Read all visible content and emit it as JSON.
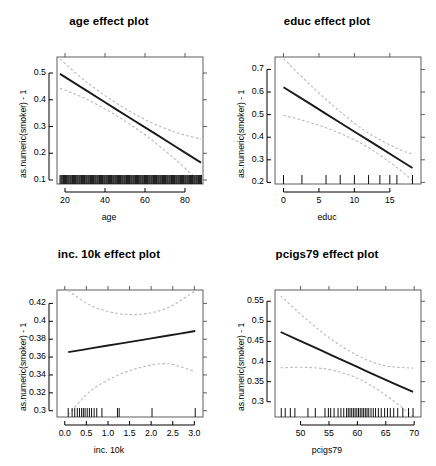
{
  "figure": {
    "layout": "2x2-grid",
    "width": 436,
    "height": 466,
    "background": "#ffffff",
    "fit_color": "#1a1a1a",
    "ci_color": "#b9b9b9",
    "rug_color": "#111111",
    "box_color": "#4d4d4d"
  },
  "chart_data": [
    {
      "type": "line",
      "title": "age effect plot",
      "xlabel": "age",
      "ylabel": "as.numeric(smoker) - 1",
      "xlim": [
        16,
        89
      ],
      "ylim": [
        0.085,
        0.56
      ],
      "xticks": [
        20,
        40,
        60,
        80
      ],
      "xtick_labels": [
        "20",
        "40",
        "60",
        "80"
      ],
      "yticks": [
        0.1,
        0.2,
        0.3,
        0.4,
        0.5
      ],
      "ytick_labels": [
        "0.1",
        "0.2",
        "0.3",
        "0.4",
        "0.5"
      ],
      "grid": false,
      "legend": "none",
      "series": [
        {
          "name": "fit",
          "style": "solid",
          "x": [
            17.5,
            30,
            45,
            60,
            75,
            88
          ],
          "values": [
            0.497,
            0.438,
            0.367,
            0.297,
            0.226,
            0.165
          ]
        },
        {
          "name": "upper 95% CI",
          "style": "dashed",
          "x": [
            17.5,
            30,
            45,
            60,
            75,
            88
          ],
          "values": [
            0.552,
            0.471,
            0.391,
            0.326,
            0.279,
            0.253
          ]
        },
        {
          "name": "lower 95% CI",
          "style": "dashed",
          "x": [
            17.5,
            30,
            45,
            60,
            75,
            88
          ],
          "values": [
            0.443,
            0.405,
            0.344,
            0.269,
            0.178,
            0.088
          ]
        }
      ],
      "rug": {
        "axis": "x",
        "note": "dense rug of observed age values across full range",
        "values": [
          17.5,
          18,
          18.4,
          18.9,
          19.3,
          19.8,
          20.2,
          20.7,
          21.1,
          21.6,
          22,
          22.5,
          22.9,
          23.4,
          23.8,
          24.3,
          24.7,
          25.2,
          25.6,
          26.1,
          26.5,
          27,
          27.4,
          27.9,
          28.3,
          28.8,
          29.2,
          29.7,
          30.1,
          30.6,
          31,
          31.5,
          31.9,
          32.4,
          32.8,
          33.3,
          33.7,
          34.2,
          34.6,
          35.1,
          35.5,
          36,
          36.4,
          36.9,
          37.3,
          37.8,
          38.2,
          38.7,
          39.1,
          39.6,
          40,
          40.5,
          40.9,
          41.4,
          41.8,
          42.3,
          42.7,
          43.2,
          43.6,
          44.1,
          44.5,
          45,
          45.4,
          45.9,
          46.3,
          46.8,
          47.2,
          47.7,
          48.1,
          48.6,
          49,
          49.5,
          49.9,
          50.4,
          50.8,
          51.3,
          51.7,
          52.2,
          52.6,
          53.1,
          53.5,
          54,
          54.4,
          54.9,
          55.3,
          55.8,
          56.2,
          56.7,
          57.1,
          57.6,
          58,
          58.5,
          58.9,
          59.4,
          59.8,
          60.3,
          60.7,
          61.2,
          61.6,
          62.1,
          62.5,
          63,
          63.4,
          63.9,
          64.3,
          64.8,
          65.2,
          65.7,
          66.1,
          66.6,
          67,
          67.5,
          67.9,
          68.4,
          68.8,
          69.3,
          69.7,
          70.2,
          70.6,
          71.1,
          71.5,
          72,
          72.4,
          72.9,
          73.3,
          73.8,
          74.2,
          74.7,
          75.1,
          75.6,
          76,
          76.5,
          76.9,
          77.4,
          77.8,
          78.3,
          78.7,
          79.2,
          79.6,
          80.1,
          80.5,
          81,
          81.4,
          81.9,
          82.3,
          82.8,
          83.2,
          83.7,
          84.1,
          84.6,
          85,
          85.5,
          85.9,
          86.4,
          86.8,
          87.3,
          87.7,
          88.2
        ]
      }
    },
    {
      "type": "line",
      "title": "educ effect plot",
      "xlabel": "educ",
      "ylabel": "as.numeric(smoker) - 1",
      "xlim": [
        -1.2,
        19.4
      ],
      "ylim": [
        0.193,
        0.755
      ],
      "xticks": [
        0,
        5,
        10,
        15
      ],
      "xtick_labels": [
        "0",
        "5",
        "10",
        "15"
      ],
      "yticks": [
        0.2,
        0.3,
        0.4,
        0.5,
        0.6,
        0.7
      ],
      "ytick_labels": [
        "0.2",
        "0.3",
        "0.4",
        "0.5",
        "0.6",
        "0.7"
      ],
      "grid": false,
      "legend": "none",
      "series": [
        {
          "name": "fit",
          "style": "solid",
          "x": [
            0,
            4,
            8,
            12,
            16,
            18.2
          ],
          "values": [
            0.621,
            0.543,
            0.464,
            0.386,
            0.307,
            0.264
          ]
        },
        {
          "name": "upper 95% CI",
          "style": "dashed",
          "x": [
            0,
            4,
            8,
            12,
            16,
            18.2
          ],
          "values": [
            0.748,
            0.625,
            0.513,
            0.418,
            0.351,
            0.325
          ]
        },
        {
          "name": "lower 95% CI",
          "style": "dashed",
          "x": [
            0,
            4,
            8,
            12,
            16,
            18.2
          ],
          "values": [
            0.497,
            0.463,
            0.417,
            0.354,
            0.266,
            0.208
          ]
        }
      ],
      "rug": {
        "axis": "x",
        "note": "rug at discrete education levels",
        "values": [
          0,
          2.6,
          6,
          8,
          10,
          12,
          13.6,
          15,
          16,
          18.2
        ]
      }
    },
    {
      "type": "line",
      "title": "inc. 10k effect plot",
      "xlabel": "inc. 10k",
      "ylabel": "as.numeric(smoker) - 1",
      "xlim": [
        -0.18,
        3.2
      ],
      "ylim": [
        0.293,
        0.435
      ],
      "xticks": [
        0.0,
        0.5,
        1.0,
        1.5,
        2.0,
        2.5,
        3.0
      ],
      "xtick_labels": [
        "0.0",
        "0.5",
        "1.0",
        "1.5",
        "2.0",
        "2.5",
        "3.0"
      ],
      "yticks": [
        0.3,
        0.32,
        0.34,
        0.36,
        0.38,
        0.4,
        0.42
      ],
      "ytick_labels": [
        "0.3",
        "0.32",
        "0.34",
        "0.36",
        "0.38",
        "0.4",
        "0.42"
      ],
      "grid": false,
      "legend": "none",
      "series": [
        {
          "name": "fit",
          "style": "solid",
          "x": [
            0.08,
            0.6,
            1.2,
            1.8,
            2.4,
            3.02
          ],
          "values": [
            0.3655,
            0.3697,
            0.3745,
            0.3793,
            0.3841,
            0.3891
          ]
        },
        {
          "name": "upper 95% CI",
          "style": "dashed",
          "x": [
            0.08,
            0.6,
            1.2,
            1.8,
            2.4,
            3.02
          ],
          "values": [
            0.4345,
            0.4177,
            0.409,
            0.408,
            0.4155,
            0.434
          ]
        },
        {
          "name": "lower 95% CI",
          "style": "dashed",
          "x": [
            0.08,
            0.6,
            1.2,
            1.8,
            2.4,
            3.02
          ],
          "values": [
            0.2955,
            0.3222,
            0.339,
            0.349,
            0.3525,
            0.3435
          ]
        }
      ],
      "rug": {
        "axis": "x",
        "note": "rug concentrated at low incomes",
        "values": [
          0.08,
          0.17,
          0.23,
          0.29,
          0.34,
          0.39,
          0.43,
          0.47,
          0.52,
          0.57,
          0.62,
          0.68,
          0.74,
          0.86,
          1.22,
          1.26,
          2.02,
          3.02
        ]
      }
    },
    {
      "type": "line",
      "title": "pcigs79 effect plot",
      "xlabel": "pcigs79",
      "ylabel": "as.numeric(smoker) - 1",
      "xlim": [
        45.5,
        71.2
      ],
      "ylim": [
        0.262,
        0.578
      ],
      "xticks": [
        50,
        55,
        60,
        65,
        70
      ],
      "xtick_labels": [
        "50",
        "55",
        "60",
        "65",
        "70"
      ],
      "yticks": [
        0.3,
        0.35,
        0.4,
        0.45,
        0.5,
        0.55
      ],
      "ytick_labels": [
        "0.3",
        "0.35",
        "0.4",
        "0.45",
        "0.5",
        "0.55"
      ],
      "grid": false,
      "legend": "none",
      "series": [
        {
          "name": "fit",
          "style": "solid",
          "x": [
            46.5,
            51,
            55.5,
            60,
            64.5,
            69.8
          ],
          "values": [
            0.4735,
            0.4445,
            0.4155,
            0.3865,
            0.3575,
            0.3245
          ]
        },
        {
          "name": "upper 95% CI",
          "style": "dashed",
          "x": [
            46.5,
            51,
            55.5,
            60,
            64.5,
            69.8
          ],
          "values": [
            0.5635,
            0.5055,
            0.4545,
            0.4155,
            0.3905,
            0.3835
          ]
        },
        {
          "name": "lower 95% CI",
          "style": "dashed",
          "x": [
            46.5,
            51,
            55.5,
            60,
            64.5,
            69.8
          ],
          "values": [
            0.3845,
            0.3855,
            0.379,
            0.3585,
            0.3215,
            0.264
          ]
        }
      ],
      "rug": {
        "axis": "x",
        "note": "rug of observed per-capita cigarette values",
        "values": [
          46.6,
          47.3,
          48.2,
          49.0,
          51.3,
          52.6,
          54.3,
          54.9,
          55.3,
          55.9,
          56.6,
          57.1,
          57.6,
          58.1,
          58.4,
          58.7,
          59.0,
          59.3,
          59.6,
          59.9,
          60.2,
          60.5,
          60.8,
          61.1,
          61.4,
          61.7,
          62.0,
          62.4,
          62.8,
          63.2,
          63.7,
          64.2,
          64.8,
          65.3,
          65.8,
          66.4,
          67.1,
          68.0,
          69.0,
          69.8
        ]
      }
    }
  ]
}
